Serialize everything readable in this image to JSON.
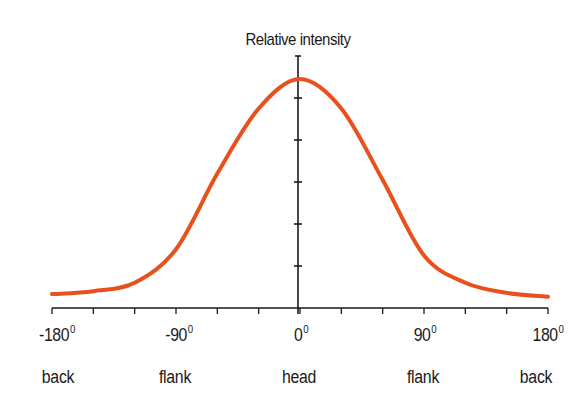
{
  "chart_data": {
    "type": "line",
    "title": "Relative intensity",
    "xlabel": "",
    "ylabel": "Relative intensity",
    "xlim": [
      -180,
      180
    ],
    "ylim": [
      0,
      6
    ],
    "grid": false,
    "legend": null,
    "x_ticks": [
      -180,
      -150,
      -120,
      -90,
      -60,
      -30,
      0,
      30,
      60,
      90,
      120,
      150,
      180
    ],
    "x_tick_labels": [
      {
        "value": -180,
        "label": "-180",
        "unit": "0"
      },
      {
        "value": -90,
        "label": "-90",
        "unit": "0"
      },
      {
        "value": 0,
        "label": "0",
        "unit": "0"
      },
      {
        "value": 90,
        "label": "90",
        "unit": "0"
      },
      {
        "value": 180,
        "label": "180",
        "unit": "0"
      }
    ],
    "x_category_labels": [
      {
        "value": -180,
        "label": "back"
      },
      {
        "value": -90,
        "label": "flank"
      },
      {
        "value": 0,
        "label": "head"
      },
      {
        "value": 90,
        "label": "flank"
      },
      {
        "value": 180,
        "label": "back"
      }
    ],
    "y_ticks": [
      1,
      2,
      3,
      4,
      5
    ],
    "y_tick_labels": [],
    "series": [
      {
        "name": "Relative intensity",
        "color": "#E8501E",
        "x": [
          -180,
          -150,
          -120,
          -90,
          -60,
          -30,
          0,
          30,
          60,
          90,
          120,
          150,
          180
        ],
        "values": [
          0.33,
          0.4,
          0.6,
          1.4,
          3.2,
          4.75,
          5.45,
          4.75,
          3.05,
          1.25,
          0.6,
          0.36,
          0.27
        ]
      }
    ]
  },
  "title": "Relative intensity",
  "axis": {
    "x_labels": [
      {
        "text": "-180",
        "deg": "0"
      },
      {
        "text": "-90",
        "deg": "0"
      },
      {
        "text": "0",
        "deg": "0"
      },
      {
        "text": "90",
        "deg": "0"
      },
      {
        "text": "180",
        "deg": "0"
      }
    ],
    "direction_labels": [
      "back",
      "flank",
      "head",
      "flank",
      "back"
    ]
  },
  "colors": {
    "curve": "#E8501E",
    "axis": "#1a1a1a",
    "text": "#1a1a1a"
  }
}
